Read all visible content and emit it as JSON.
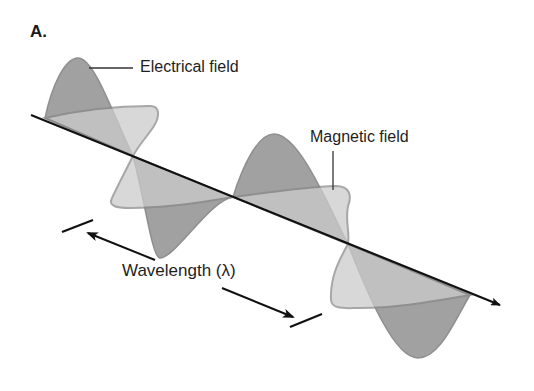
{
  "figure": {
    "panel_label": "A.",
    "labels": {
      "electric": "Electrical field",
      "magnetic": "Magnetic field",
      "wavelength": "Wavelength (λ)"
    },
    "colors": {
      "electric_fill": "#9c9c9c",
      "magnetic_fill": "#cbcbcb",
      "wave_stroke": "#8a8a8a",
      "axis": "#111111",
      "background": "#ffffff"
    }
  }
}
